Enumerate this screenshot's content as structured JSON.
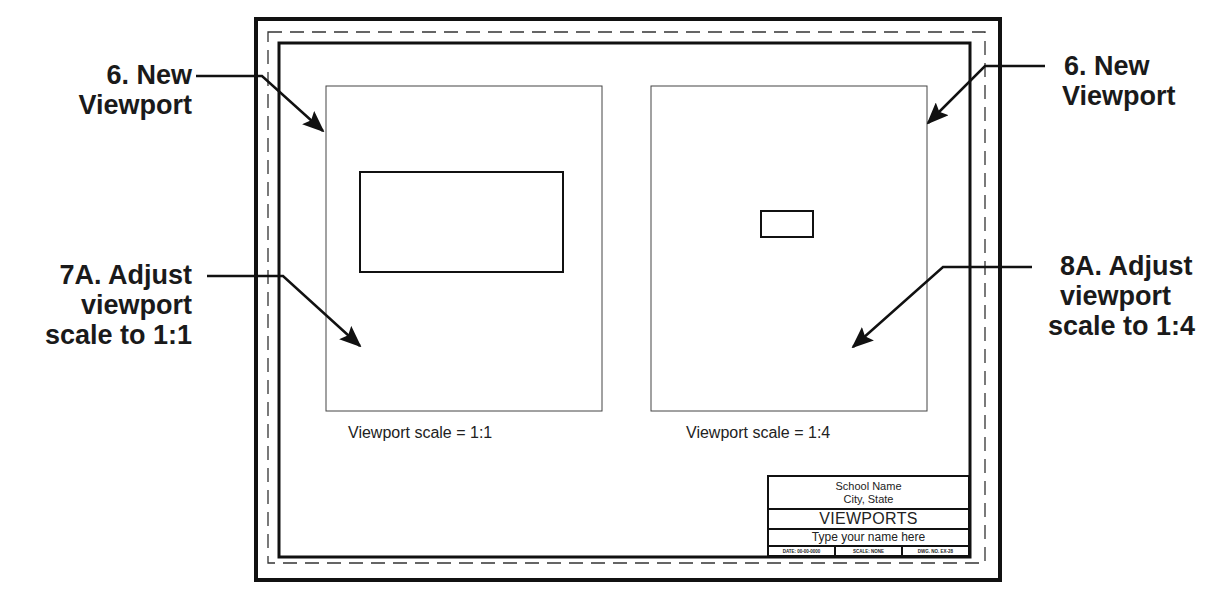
{
  "callouts": {
    "top_left": {
      "line1": "6.  New",
      "line2": "Viewport"
    },
    "top_right": {
      "line1": "6.  New",
      "line2": "Viewport"
    },
    "mid_left": {
      "line1": "7A. Adjust",
      "line2": "viewport",
      "line3": "scale to 1:1"
    },
    "mid_right": {
      "line1": "8A. Adjust",
      "line2": "viewport",
      "line3": "scale to 1:4"
    }
  },
  "viewports": [
    {
      "caption": "Viewport scale = 1:1",
      "scale": "1:1"
    },
    {
      "caption": "Viewport scale = 1:4",
      "scale": "1:4"
    }
  ],
  "title_block": {
    "school": "School Name",
    "location": "City, State",
    "title": "VIEWPORTS",
    "student_name": "Type your name here",
    "date": "DATE: 00-00-0000",
    "scale": "SCALE: NONE",
    "drawing_number": "DWG. NO. EX-28"
  },
  "colors": {
    "line": "#111111",
    "background": "#ffffff",
    "text": "#1a1a1a"
  }
}
